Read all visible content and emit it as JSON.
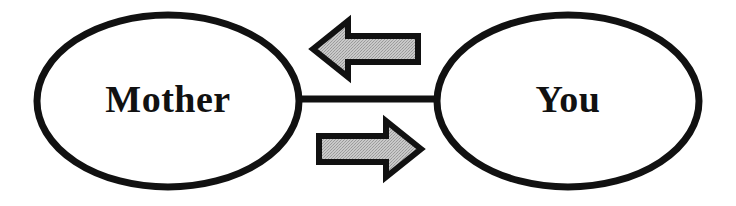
{
  "diagram": {
    "type": "relationship-diagram",
    "background_color": "#ffffff",
    "outline_color": "#111111",
    "node_fill_color": "#ffffff",
    "arrow_fill_color": "#b9b9b9",
    "arrow_outline_color": "#111111",
    "connector_color": "#111111",
    "nodes": [
      {
        "id": "mother",
        "label": "Mother",
        "shape": "ellipse",
        "cx": 168,
        "cy": 101,
        "rx": 131,
        "ry": 86
      },
      {
        "id": "you",
        "label": "You",
        "shape": "ellipse",
        "cx": 568,
        "cy": 101,
        "rx": 131,
        "ry": 86
      }
    ],
    "connector": {
      "id": "mother-you-link",
      "from": "mother",
      "to": "you",
      "x1": 299,
      "x2": 438,
      "y": 99,
      "thickness": 7
    },
    "arrows": [
      {
        "id": "arrow-to-mother",
        "direction": "left",
        "from": "you",
        "to": "mother",
        "x": 313,
        "y": 18,
        "width": 107,
        "height": 62
      },
      {
        "id": "arrow-to-you",
        "direction": "right",
        "from": "mother",
        "to": "you",
        "x": 316,
        "y": 118,
        "width": 105,
        "height": 63
      }
    ]
  }
}
